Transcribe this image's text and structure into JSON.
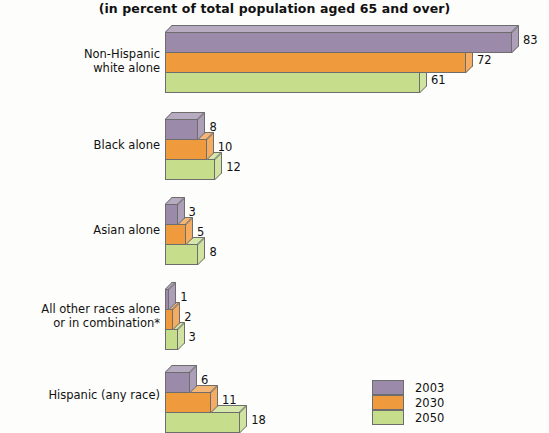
{
  "chart_data": {
    "type": "bar",
    "orientation": "horizontal",
    "title": "(in percent of total population aged 65 and over)",
    "xlabel": "",
    "ylabel": "",
    "xlim": [
      0,
      83
    ],
    "grid": false,
    "legend_position": "bottom-right",
    "categories": [
      "Non-Hispanic\nwhite alone",
      "Black alone",
      "Asian alone",
      "All other races alone\nor in combination*",
      "Hispanic (any race)"
    ],
    "series": [
      {
        "name": "2003",
        "color": "#9b8aa9",
        "values": [
          83,
          8,
          3,
          1,
          6
        ]
      },
      {
        "name": "2030",
        "color": "#f09a3e",
        "values": [
          72,
          10,
          5,
          2,
          11
        ]
      },
      {
        "name": "2050",
        "color": "#c6dd8c",
        "values": [
          61,
          12,
          8,
          3,
          18
        ]
      }
    ]
  },
  "legend": {
    "items": [
      {
        "label": "2003",
        "color": "#9b8aa9"
      },
      {
        "label": "2030",
        "color": "#f09a3e"
      },
      {
        "label": "2050",
        "color": "#c6dd8c"
      }
    ]
  },
  "groups": [
    {
      "label": "Non-Hispanic\nwhite alone",
      "bars": [
        {
          "series": "2003",
          "value": "83"
        },
        {
          "series": "2030",
          "value": "72"
        },
        {
          "series": "2050",
          "value": "61"
        }
      ]
    },
    {
      "label": "Black alone",
      "bars": [
        {
          "series": "2003",
          "value": "8"
        },
        {
          "series": "2030",
          "value": "10"
        },
        {
          "series": "2050",
          "value": "12"
        }
      ]
    },
    {
      "label": "Asian alone",
      "bars": [
        {
          "series": "2003",
          "value": "3"
        },
        {
          "series": "2030",
          "value": "5"
        },
        {
          "series": "2050",
          "value": "8"
        }
      ]
    },
    {
      "label": "All other races alone\nor in combination*",
      "bars": [
        {
          "series": "2003",
          "value": "1"
        },
        {
          "series": "2030",
          "value": "2"
        },
        {
          "series": "2050",
          "value": "3"
        }
      ]
    },
    {
      "label": "Hispanic (any race)",
      "bars": [
        {
          "series": "2003",
          "value": "6"
        },
        {
          "series": "2030",
          "value": "11"
        },
        {
          "series": "2050",
          "value": "18"
        }
      ]
    }
  ]
}
